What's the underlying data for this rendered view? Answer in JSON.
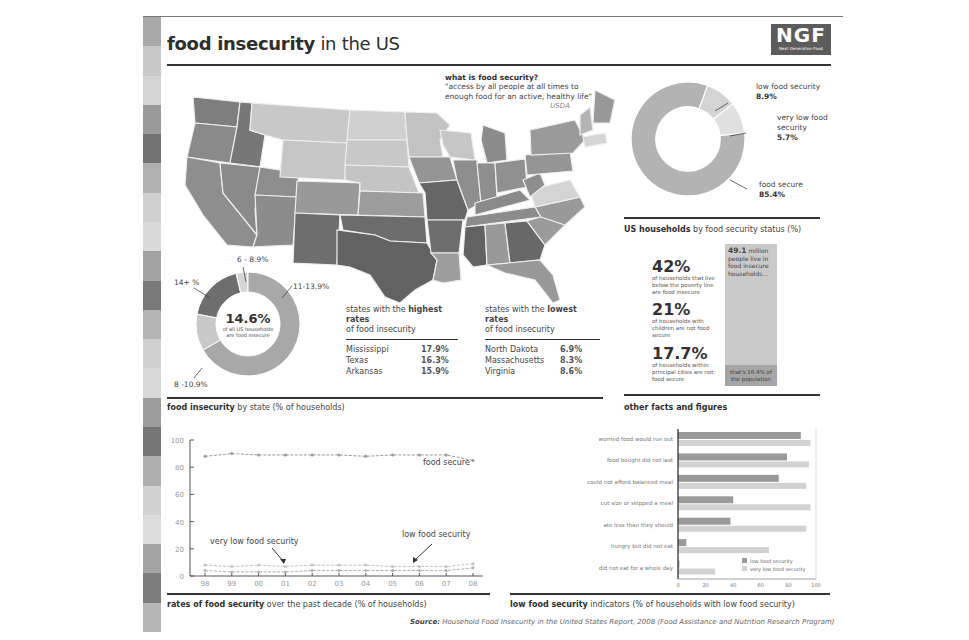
{
  "header": {
    "title_bold": "food insecurity",
    "title_rest": " in the US",
    "logo_text": "NGF",
    "logo_subtext": "Next Generation Food"
  },
  "definition": {
    "heading": "what is food security?",
    "quote_line1": "\"access by all people at all times to",
    "quote_line2": "enough food for an active, healthy life\"",
    "source": "USDA"
  },
  "colors": {
    "darkest": "#5e5e5e",
    "dark": "#7a7a7a",
    "medium": "#999999",
    "light": "#b8b8b8",
    "lightest": "#d6d6d6",
    "rule": "#333333"
  },
  "map_legend_donut": {
    "center_value": "14.6%",
    "center_line1": "of all US households",
    "center_line2": "are food insecure",
    "segments": [
      {
        "label": "6 - 8.9%",
        "share": 7,
        "color": "#d6d6d6"
      },
      {
        "label": "11-13.9%",
        "share": 50,
        "color": "#a8a8a8"
      },
      {
        "label": "8 -10.9%",
        "share": 27,
        "color": "#c4c4c4"
      },
      {
        "label": "14+ %",
        "share": 16,
        "color": "#6e6e6e"
      }
    ]
  },
  "highest_rates": {
    "heading_pre": "states with the ",
    "heading_bold": "highest rates",
    "heading_post": "of food insecurity",
    "rows": [
      {
        "state": "Mississippi",
        "value": "17.9%"
      },
      {
        "state": "Texas",
        "value": "16.3%"
      },
      {
        "state": "Arkansas",
        "value": "15.9%"
      }
    ]
  },
  "lowest_rates": {
    "heading_pre": "states with the ",
    "heading_bold": "lowest rates",
    "heading_post": "of food insecurity",
    "rows": [
      {
        "state": "North Dakota",
        "value": "6.9%"
      },
      {
        "state": "Massachusetts",
        "value": "8.3%"
      },
      {
        "state": "Virginia",
        "value": "8.6%"
      }
    ]
  },
  "map_caption": {
    "bold": "food insecurity",
    "rest": " by state (% of households)"
  },
  "status_donut": {
    "caption_bold": "US households",
    "caption_rest": " by food security status (%)",
    "segments": [
      {
        "label": "low food security",
        "value": "8.9%",
        "share": 8.9,
        "color": "#d4d4d4"
      },
      {
        "label_line1": "very low food",
        "label_line2": "security",
        "value": "5.7%",
        "share": 5.7,
        "color": "#e2e2e2"
      },
      {
        "label": "food secure",
        "value": "85.4%",
        "share": 85.4,
        "color": "#b3b3b3"
      }
    ]
  },
  "facts": {
    "caption": "other facts and figures",
    "stats": [
      {
        "num": "42%",
        "desc": "of households that live below the poverty line are food insecure"
      },
      {
        "num": "21%",
        "desc": "of households with children are not food secure"
      },
      {
        "num": "17.7%",
        "desc": "of households within principal cities are not food secure"
      }
    ],
    "bar_top_bold": "49.1",
    "bar_top_text": " million people live in food insecure households...",
    "bar_bottom_text": "that's 16.4% of the population"
  },
  "chart_data": [
    {
      "type": "line",
      "title": "rates of food security over the past decade (% of households)",
      "x": [
        "98",
        "99",
        "00",
        "01",
        "02",
        "03",
        "04",
        "05",
        "06",
        "07",
        "08"
      ],
      "ylim": [
        0,
        100
      ],
      "yticks": [
        0,
        20,
        40,
        60,
        80,
        100
      ],
      "series": [
        {
          "name": "food secure",
          "values": [
            88,
            90,
            89,
            89,
            89,
            89,
            88,
            89,
            89,
            89,
            85
          ]
        },
        {
          "name": "low food security",
          "values": [
            8,
            7,
            8,
            7,
            8,
            8,
            8,
            7,
            7,
            7,
            9
          ]
        },
        {
          "name": "very low food security",
          "values": [
            4,
            3,
            3,
            3,
            4,
            4,
            4,
            4,
            4,
            4,
            6
          ]
        }
      ],
      "annotations": [
        "food secure",
        "low food security",
        "very low food security"
      ]
    },
    {
      "type": "bar",
      "orientation": "horizontal",
      "title": "low food security indicators (% of households with low food security)",
      "categories": [
        "worried food would run out",
        "food bought did not last",
        "could not afford balanced meal",
        "cut size or skipped a meal",
        "ate less than they should",
        "hungry but did not eat",
        "did not eat for a whole day"
      ],
      "series": [
        {
          "name": "low food security",
          "values": [
            89,
            79,
            73,
            40,
            38,
            6,
            1
          ]
        },
        {
          "name": "very low food security",
          "values": [
            96,
            95,
            93,
            96,
            93,
            66,
            27
          ]
        }
      ],
      "xlim": [
        0,
        100
      ],
      "xticks": [
        0,
        20,
        40,
        60,
        80,
        100
      ],
      "legend_position": "bottom-right"
    }
  ],
  "line_chart": {
    "caption_bold": "rates of food security",
    "caption_rest": " over the past decade (% of households)",
    "label_food_secure": "food secure",
    "label_low": "low food security",
    "label_very_low": "very low food security"
  },
  "bar_chart": {
    "caption_bold": "low food security",
    "caption_rest": " indicators (% of households with low food security)",
    "legend_low": "low food security",
    "legend_very_low": "very low food security"
  },
  "source": {
    "label": "Source:",
    "text": " Household Food Insecurity in the United States Report, 2008 (Food Assistance and Nutrition Research Program)"
  }
}
